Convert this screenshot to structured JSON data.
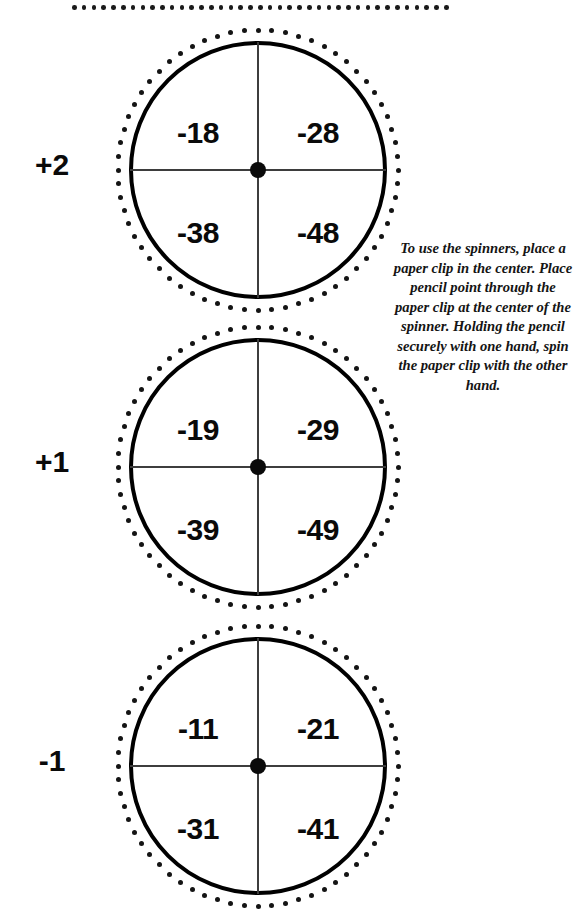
{
  "page": {
    "background_color": "#ffffff",
    "ink_color": "#0a0a0a"
  },
  "top_partial_spinner": {
    "description": "dotted-edge remnant of a spinner cropped off the top of the page",
    "dot_count": 39
  },
  "instructions": {
    "text": "To use the spinners, place a paper clip in the center. Place pencil point through the paper clip at the center of the spinner. Holding the pencil securely with one hand, spin the paper clip with the other hand."
  },
  "spinners": [
    {
      "caption": "+2",
      "sectors": {
        "top_left": "-18",
        "top_right": "-28",
        "bottom_left": "-38",
        "bottom_right": "-48"
      }
    },
    {
      "caption": "+1",
      "sectors": {
        "top_left": "-19",
        "top_right": "-29",
        "bottom_left": "-39",
        "bottom_right": "-49"
      }
    },
    {
      "caption": "-1",
      "sectors": {
        "top_left": "-11",
        "top_right": "-21",
        "bottom_left": "-31",
        "bottom_right": "-41"
      }
    }
  ]
}
